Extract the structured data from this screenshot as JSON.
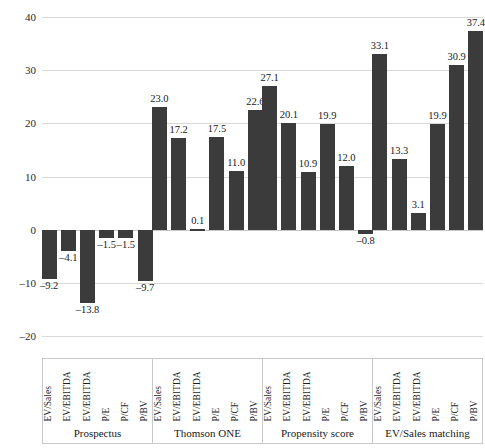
{
  "chart_data": {
    "type": "bar",
    "title": "",
    "subtitle": "",
    "xlabel": "",
    "ylabel": "",
    "ylim": [
      -20,
      40
    ],
    "yticks": [
      40,
      30,
      20,
      10,
      0,
      -10,
      -20
    ],
    "ytick_labels": [
      "40",
      "30",
      "20",
      "10",
      "0",
      "–10",
      "–20"
    ],
    "grid": true,
    "legend": "none",
    "orientation": "vertical",
    "bar_color": "#3b3b3b",
    "grid_color": "#d9d9d9",
    "categories": [
      "EV/Sales",
      "EV/EBITDA",
      "EV/EBITDA",
      "P/E",
      "P/CF",
      "P/BV"
    ],
    "groups": [
      {
        "name": "Prospectus",
        "categories": [
          "EV/Sales",
          "EV/EBITDA",
          "EV/EBITDA",
          "P/E",
          "P/CF",
          "P/BV"
        ],
        "values": [
          -9.2,
          -4.1,
          -13.8,
          -1.5,
          -1.5,
          -9.7
        ],
        "labels": [
          "–9.2",
          "–4.1",
          "–13.8",
          "–1.5",
          "–1.5",
          "–9.7"
        ]
      },
      {
        "name": "Thomson ONE",
        "categories": [
          "EV/Sales",
          "EV/EBITDA",
          "EV/EBITDA",
          "P/E",
          "P/CF",
          "P/BV"
        ],
        "values": [
          23.0,
          17.2,
          0.1,
          17.5,
          11.0,
          22.6
        ],
        "labels": [
          "23.0",
          "17.2",
          "0.1",
          "17.5",
          "11.0",
          "22.6"
        ]
      },
      {
        "name": "Propensity score",
        "categories": [
          "EV/Sales",
          "EV/EBITDA",
          "EV/EBITDA",
          "P/E",
          "P/CF",
          "P/BV"
        ],
        "values": [
          27.1,
          20.1,
          10.9,
          19.9,
          12.0,
          -0.8
        ],
        "labels": [
          "27.1",
          "20.1",
          "10.9",
          "19.9",
          "12.0",
          "–0.8"
        ]
      },
      {
        "name": "EV/Sales matching",
        "categories": [
          "EV/Sales",
          "EV/EBITDA",
          "EV/EBITDA",
          "P/E",
          "P/CF",
          "P/BV"
        ],
        "values": [
          33.1,
          13.3,
          3.1,
          19.9,
          30.9,
          37.4
        ],
        "labels": [
          "33.1",
          "13.3",
          "3.1",
          "19.9",
          "30.9",
          "37.4"
        ]
      }
    ]
  }
}
